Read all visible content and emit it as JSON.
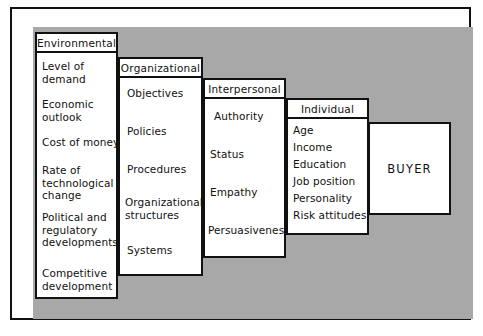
{
  "figure": {
    "background_color": "#a8a8a8",
    "frame_color": "#111111",
    "box_fill": "#ffffff"
  },
  "columns": [
    {
      "id": "environmental",
      "header": "Environmental",
      "items": [
        "Level of\ndemand",
        "Economic\noutlook",
        "Cost of money",
        "Rate of\ntechnological\nchange",
        "Political and\nregulatory\ndevelopments",
        "Competitive\ndevelopment"
      ]
    },
    {
      "id": "organizational",
      "header": "Organizational",
      "items": [
        "Objectives",
        "Policies",
        "Procedures",
        "Organizational\nstructures",
        "Systems"
      ]
    },
    {
      "id": "interpersonal",
      "header": "Interpersonal",
      "items": [
        "Authority",
        "Status",
        "Empathy",
        "Persuasiveness"
      ]
    },
    {
      "id": "individual",
      "header": "Individual",
      "items": [
        "Age",
        "Income",
        "Education",
        "Job position",
        "Personality",
        "Risk attitudes"
      ]
    }
  ],
  "outcome": {
    "label": "BUYER"
  }
}
